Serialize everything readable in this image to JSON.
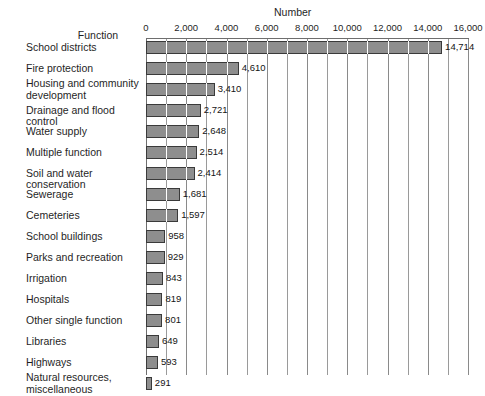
{
  "chart_data": {
    "type": "bar",
    "orientation": "horizontal",
    "title": "",
    "xlabel": "Number",
    "ylabel": "Function",
    "xlim": [
      0,
      16000
    ],
    "xticks": [
      0,
      2000,
      4000,
      6000,
      8000,
      10000,
      12000,
      14000,
      16000
    ],
    "xticklabels": [
      "0",
      "2,000",
      "4,000",
      "6,000",
      "8,000",
      "10,000",
      "12,000",
      "14,000",
      "16,000"
    ],
    "minor_tick_step": 1000,
    "grid": true,
    "legend": "none",
    "bar_color": "#8e8e8e",
    "bar_edge_color": "#3a3a3a",
    "categories": [
      "School districts",
      "Fire protection",
      "Housing and community development",
      "Drainage and flood control",
      "Water supply",
      "Multiple function",
      "Soil and water conservation",
      "Sewerage",
      "Cemeteries",
      "School buildings",
      "Parks and recreation",
      "Irrigation",
      "Hospitals",
      "Other single function",
      "Libraries",
      "Highways",
      "Natural resources, miscellaneous"
    ],
    "values": [
      14714,
      4610,
      3410,
      2721,
      2648,
      2514,
      2414,
      1681,
      1597,
      958,
      929,
      843,
      819,
      801,
      649,
      593,
      291
    ],
    "value_labels": [
      "14,714",
      "4,610",
      "3,410",
      "2,721",
      "2,648",
      "2,514",
      "2,414",
      "1,681",
      "1,597",
      "958",
      "929",
      "843",
      "819",
      "801",
      "649",
      "593",
      "291"
    ],
    "bars": [
      {
        "label_lines": [
          "School districts"
        ],
        "value": 14714,
        "value_label": "14,714"
      },
      {
        "label_lines": [
          "Fire protection"
        ],
        "value": 4610,
        "value_label": "4,610"
      },
      {
        "label_lines": [
          "Housing and community",
          "development"
        ],
        "value": 3410,
        "value_label": "3,410"
      },
      {
        "label_lines": [
          "Drainage and flood control"
        ],
        "value": 2721,
        "value_label": "2,721"
      },
      {
        "label_lines": [
          "Water supply"
        ],
        "value": 2648,
        "value_label": "2,648"
      },
      {
        "label_lines": [
          "Multiple function"
        ],
        "value": 2514,
        "value_label": "2,514"
      },
      {
        "label_lines": [
          "Soil and water conservation"
        ],
        "value": 2414,
        "value_label": "2,414"
      },
      {
        "label_lines": [
          "Sewerage"
        ],
        "value": 1681,
        "value_label": "1,681"
      },
      {
        "label_lines": [
          "Cemeteries"
        ],
        "value": 1597,
        "value_label": "1,597"
      },
      {
        "label_lines": [
          "School buildings"
        ],
        "value": 958,
        "value_label": "958"
      },
      {
        "label_lines": [
          "Parks and recreation"
        ],
        "value": 929,
        "value_label": "929"
      },
      {
        "label_lines": [
          "Irrigation"
        ],
        "value": 843,
        "value_label": "843"
      },
      {
        "label_lines": [
          "Hospitals"
        ],
        "value": 819,
        "value_label": "819"
      },
      {
        "label_lines": [
          "Other single function"
        ],
        "value": 801,
        "value_label": "801"
      },
      {
        "label_lines": [
          "Libraries"
        ],
        "value": 649,
        "value_label": "649"
      },
      {
        "label_lines": [
          "Highways"
        ],
        "value": 593,
        "value_label": "593"
      },
      {
        "label_lines": [
          "Natural resources,",
          "miscellaneous"
        ],
        "value": 291,
        "value_label": "291"
      }
    ]
  }
}
